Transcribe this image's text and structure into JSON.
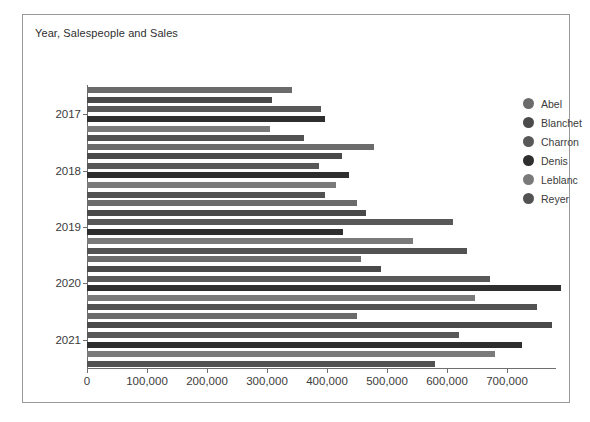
{
  "chart": {
    "title": "Year, Salespeople and Sales"
  },
  "legend": {
    "position": "right",
    "items": [
      {
        "label": "Abel",
        "color": "#6b6b6b"
      },
      {
        "label": "Blanchet",
        "color": "#4a4a4a"
      },
      {
        "label": "Charron",
        "color": "#585858"
      },
      {
        "label": "Denis",
        "color": "#2e2e2e"
      },
      {
        "label": "Leblanc",
        "color": "#7a7a7a"
      },
      {
        "label": "Reyer",
        "color": "#525252"
      }
    ]
  },
  "axes": {
    "x": {
      "label": "",
      "ticks": [
        "0",
        "100,000",
        "200,000",
        "300,000",
        "400,000",
        "500,000",
        "600,000",
        "700,000"
      ],
      "values": [
        0,
        100000,
        200000,
        300000,
        400000,
        500000,
        600000,
        700000
      ],
      "min": 0,
      "max": 780000
    },
    "y": {
      "label": "",
      "ticks": [
        "2017",
        "2018",
        "2019",
        "2020",
        "2021"
      ]
    }
  },
  "chart_data": {
    "type": "bar",
    "orientation": "horizontal",
    "title": "Year, Salespeople and Sales",
    "xlabel": "",
    "ylabel": "",
    "xlim": [
      0,
      780000
    ],
    "grid": false,
    "legend_position": "right",
    "categories": [
      "2017",
      "2018",
      "2019",
      "2020",
      "2021"
    ],
    "series": [
      {
        "name": "Abel",
        "color": "#6b6b6b",
        "values": [
          342000,
          700000,
          650000,
          585000,
          640000
        ]
      },
      {
        "name": "Blanchet",
        "color": "#4a4a4a",
        "values": [
          309000,
          425000,
          465000,
          490000,
          775000
        ]
      },
      {
        "name": "Charron",
        "color": "#585858",
        "values": [
          390000,
          385000,
          910000,
          880000,
          1205000
        ]
      },
      {
        "name": "Denis",
        "color": "#2e2e2e",
        "values": [
          396000,
          437000,
          640000,
          1307000,
          1050000
        ]
      },
      {
        "name": "Leblanc",
        "color": "#7a7a7a",
        "values": [
          305000,
          415000,
          905000,
          1097000,
          907000
        ]
      },
      {
        "name": "Reyer",
        "color": "#525252",
        "values": [
          361000,
          390000,
          640000,
          570000,
          580000
        ]
      }
    ],
    "bars": [
      {
        "year": "2017",
        "salesperson": "Abel",
        "value": 342000
      },
      {
        "year": "2017",
        "salesperson": "Blanchet",
        "value": 309000
      },
      {
        "year": "2017",
        "salesperson": "Charron",
        "value": 390000
      },
      {
        "year": "2017",
        "salesperson": "Denis",
        "value": 396000
      },
      {
        "year": "2017",
        "salesperson": "Leblanc",
        "value": 305000
      },
      {
        "year": "2017",
        "salesperson": "Reyer",
        "value": 361000
      },
      {
        "year": "2018",
        "salesperson": "Abel",
        "value": 478000
      },
      {
        "year": "2018",
        "salesperson": "Blanchet",
        "value": 425000
      },
      {
        "year": "2018",
        "salesperson": "Charron",
        "value": 386000
      },
      {
        "year": "2018",
        "salesperson": "Denis",
        "value": 437000
      },
      {
        "year": "2018",
        "salesperson": "Leblanc",
        "value": 415000
      },
      {
        "year": "2018",
        "salesperson": "Reyer",
        "value": 396000
      },
      {
        "year": "2019",
        "salesperson": "Abel",
        "value": 450000
      },
      {
        "year": "2019",
        "salesperson": "Blanchet",
        "value": 465000
      },
      {
        "year": "2019",
        "salesperson": "Charron",
        "value": 610000
      },
      {
        "year": "2019",
        "salesperson": "Denis",
        "value": 427000
      },
      {
        "year": "2019",
        "salesperson": "Leblanc",
        "value": 543000
      },
      {
        "year": "2019",
        "salesperson": "Reyer",
        "value": 634000
      },
      {
        "year": "2020",
        "salesperson": "Abel",
        "value": 456000
      },
      {
        "year": "2020",
        "salesperson": "Blanchet",
        "value": 490000
      },
      {
        "year": "2020",
        "salesperson": "Charron",
        "value": 672000
      },
      {
        "year": "2020",
        "salesperson": "Denis",
        "value": 790000
      },
      {
        "year": "2020",
        "salesperson": "Leblanc",
        "value": 647000
      },
      {
        "year": "2020",
        "salesperson": "Reyer",
        "value": 750000
      },
      {
        "year": "2021",
        "salesperson": "Abel",
        "value": 450000
      },
      {
        "year": "2021",
        "salesperson": "Blanchet",
        "value": 775000
      },
      {
        "year": "2021",
        "salesperson": "Charron",
        "value": 620000
      },
      {
        "year": "2021",
        "salesperson": "Denis",
        "value": 725000
      },
      {
        "year": "2021",
        "salesperson": "Leblanc",
        "value": 680000
      },
      {
        "year": "2021",
        "salesperson": "Reyer",
        "value": 580000
      }
    ]
  }
}
